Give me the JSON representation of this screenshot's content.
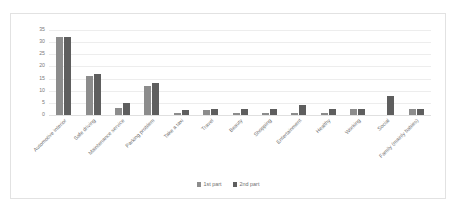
{
  "chart_data": {
    "type": "bar",
    "title": "",
    "subtitle": "",
    "xlabel": "",
    "ylabel": "",
    "ylim": [
      0,
      35
    ],
    "yticks": [
      0,
      5,
      10,
      15,
      20,
      25,
      30,
      35
    ],
    "grid": true,
    "legend_position": "bottom-center",
    "categories": [
      "Automotive interior",
      "Safe driving",
      "Maintenance service",
      "Parking problem",
      "Take a taxi",
      "Travel",
      "Beauty",
      "Shopping",
      "Entertainment",
      "Healthy",
      "Working",
      "Social",
      "Family (mainly babies)"
    ],
    "series": [
      {
        "name": "1st part",
        "color": "#8c8c8c",
        "values": [
          32,
          16,
          3,
          12,
          1,
          2,
          1,
          1,
          1,
          1,
          2.5,
          0,
          2.5
        ]
      },
      {
        "name": "2nd part",
        "color": "#5e5e5e",
        "values": [
          32,
          17,
          5,
          13,
          2,
          2.5,
          2.5,
          2.5,
          4,
          2.5,
          2.5,
          8,
          2.5
        ]
      }
    ]
  },
  "legend": {
    "items": [
      {
        "label": "1st part",
        "color": "#8c8c8c"
      },
      {
        "label": "2nd part",
        "color": "#5e5e5e"
      }
    ]
  },
  "colors": {
    "series1": "#8c8c8c",
    "series2": "#5e5e5e",
    "gridline": "#ededed",
    "frame_border": "#e2e2e2",
    "tick_text": "#7b7b7b",
    "label_text": "#6f6f6f",
    "background": "#ffffff"
  }
}
